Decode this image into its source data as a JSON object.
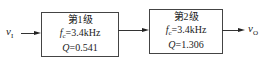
{
  "diagram": {
    "input_label": "v",
    "input_sub": "I",
    "output_label": "v",
    "output_sub": "O",
    "stages": [
      {
        "title": "第1级",
        "fc_symbol": "f",
        "fc_sub": "c",
        "fc_value": "=3.4kHz",
        "q_symbol": "Q",
        "q_value": "=0.541"
      },
      {
        "title": "第2级",
        "fc_symbol": "f",
        "fc_sub": "c",
        "fc_value": "=3.4kHz",
        "q_symbol": "Q",
        "q_value": "=1.306"
      }
    ]
  }
}
